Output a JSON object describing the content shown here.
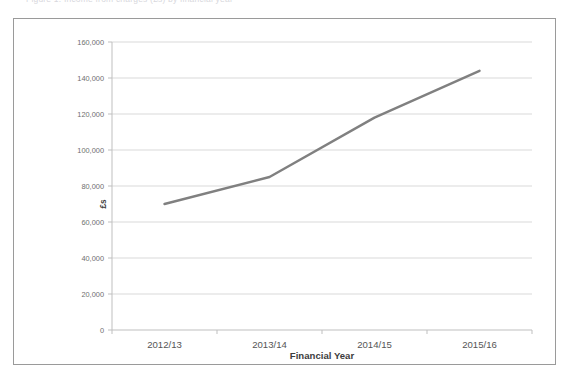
{
  "page": {
    "top_caption": "Figure 1: Income from charges (£s) by financial year"
  },
  "chart_data": {
    "type": "line",
    "title": "",
    "categories": [
      "2012/13",
      "2013/14",
      "2014/15",
      "2015/16"
    ],
    "values": [
      70000,
      85000,
      118000,
      144000
    ],
    "series": [
      {
        "name": "Income",
        "values": [
          70000,
          85000,
          118000,
          144000
        ],
        "color": "#808080"
      }
    ],
    "xlabel": "Financial Year",
    "ylabel": "£s",
    "ylim": [
      0,
      160000
    ],
    "ytick_step": 20000,
    "ytick_labels": [
      "0",
      "20,000",
      "40,000",
      "60,000",
      "80,000",
      "100,000",
      "120,000",
      "140,000",
      "160,000"
    ],
    "ytick_values": [
      0,
      20000,
      40000,
      60000,
      80000,
      100000,
      120000,
      140000,
      160000
    ],
    "grid": "horizontal",
    "legend": "none",
    "line_color": "#808080",
    "line_width": 2.4,
    "gridline_color": "#d9d9d9",
    "axis_color": "#bfbfbf",
    "plot_background": "#ffffff"
  }
}
